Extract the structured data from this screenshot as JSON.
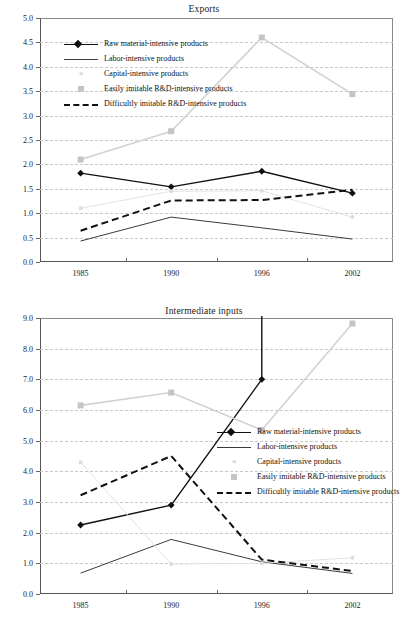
{
  "document": {
    "kind": "two-panel-line-chart-figure"
  },
  "colors": {
    "raw_material": "#111111",
    "labor": "#3a3a3a",
    "capital": "#e2e2e2",
    "easily_imitable": "#d2d2d2",
    "difficultly_imitable": "#111111",
    "grid": "#c9c9c9",
    "axis": "#555555"
  },
  "legend": {
    "entries": [
      {
        "label": "Raw material-intensive products",
        "key": "line-diamond-black"
      },
      {
        "label": "Labor-intensive products",
        "key": "line-thin-black"
      },
      {
        "label": "Capital-intensive products",
        "key": "dot-light-gray"
      },
      {
        "label": "Easily imitable R&D-intensive products",
        "key": "square-gray"
      },
      {
        "label": "Difficultly imitable R&D-intensive products",
        "key": "dashed-black"
      }
    ]
  },
  "chart_data": [
    {
      "type": "line",
      "title": "Exports",
      "xlabel": "",
      "ylabel": "",
      "x": [
        "1985",
        "1990",
        "1996",
        "2002"
      ],
      "categories": [
        "1985",
        "1990",
        "1996",
        "2002"
      ],
      "ylim": [
        0.0,
        5.0
      ],
      "ytick_labels": [
        "0.0",
        "0.5",
        "1.0",
        "1.5",
        "2.0",
        "2.5",
        "3.0",
        "3.5",
        "4.0",
        "4.5",
        "5.0"
      ],
      "yticks": [
        0.0,
        0.5,
        1.0,
        1.5,
        2.0,
        2.5,
        3.0,
        3.5,
        4.0,
        4.5,
        5.0
      ],
      "grid": true,
      "legend_position": "upper-left-inside",
      "series": [
        {
          "name": "Raw material-intensive products",
          "values": [
            1.82,
            1.54,
            1.86,
            1.41
          ],
          "color": "#111111",
          "style": "solid",
          "width": 1.4,
          "marker": "diamond",
          "marker_color": "#111111"
        },
        {
          "name": "Labor-intensive products",
          "values": [
            0.43,
            0.92,
            0.7,
            0.47
          ],
          "color": "#3a3a3a",
          "style": "solid",
          "width": 1.0,
          "marker": "none"
        },
        {
          "name": "Capital-intensive products",
          "values": [
            1.1,
            1.45,
            1.46,
            0.92
          ],
          "color": "#e2e2e2",
          "style": "solid",
          "width": 1.0,
          "marker": "dot",
          "marker_color": "#dcdcdc"
        },
        {
          "name": "Easily imitable R&D-intensive products",
          "values": [
            2.1,
            2.68,
            4.6,
            3.44
          ],
          "color": "#d2d2d2",
          "style": "solid",
          "width": 1.6,
          "marker": "square",
          "marker_color": "#c4c4c4"
        },
        {
          "name": "Difficultly imitable R&D-intensive products",
          "values": [
            0.64,
            1.26,
            1.27,
            1.48
          ],
          "color": "#111111",
          "style": "dashed",
          "width": 2.0,
          "marker": "none"
        }
      ]
    },
    {
      "type": "line",
      "title": "Intermediate inputs",
      "xlabel": "",
      "ylabel": "",
      "x": [
        "1985",
        "1990",
        "1996",
        "2002"
      ],
      "categories": [
        "1985",
        "1990",
        "1996",
        "2002"
      ],
      "ylim": [
        0.0,
        9.0
      ],
      "ytick_labels": [
        "0.0",
        "1.0",
        "2.0",
        "3.0",
        "4.0",
        "5.0",
        "6.0",
        "7.0",
        "8.0",
        "9.0"
      ],
      "yticks": [
        0.0,
        1.0,
        2.0,
        3.0,
        4.0,
        5.0,
        6.0,
        7.0,
        8.0,
        9.0
      ],
      "grid": true,
      "legend_position": "center-right-inside",
      "series": [
        {
          "name": "Raw material-intensive products",
          "values": [
            2.25,
            2.9,
            7.0,
            null
          ],
          "clipped_above": true,
          "color": "#111111",
          "style": "solid",
          "width": 1.4,
          "marker": "diamond",
          "marker_color": "#111111"
        },
        {
          "name": "Labor-intensive products",
          "values": [
            0.68,
            1.78,
            1.05,
            0.67
          ],
          "color": "#3a3a3a",
          "style": "solid",
          "width": 1.0,
          "marker": "none"
        },
        {
          "name": "Capital-intensive products",
          "values": [
            4.3,
            0.98,
            1.0,
            1.18
          ],
          "color": "#e2e2e2",
          "style": "solid",
          "width": 1.0,
          "marker": "dot",
          "marker_color": "#dcdcdc"
        },
        {
          "name": "Easily imitable R&D-intensive products",
          "values": [
            6.15,
            6.57,
            5.35,
            8.82
          ],
          "color": "#d2d2d2",
          "style": "solid",
          "width": 1.6,
          "marker": "square",
          "marker_color": "#c4c4c4"
        },
        {
          "name": "Difficultly imitable R&D-intensive products",
          "values": [
            3.22,
            4.5,
            1.12,
            0.75
          ],
          "color": "#111111",
          "style": "dashed",
          "width": 2.0,
          "marker": "none"
        }
      ]
    }
  ]
}
